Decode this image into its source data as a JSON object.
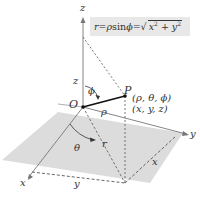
{
  "diagram": {
    "formula": {
      "lhs": "r",
      "eq1": " = ",
      "rho": "ρ",
      "sin": " sin ",
      "phi": "ϕ",
      "eq2": " = ",
      "radical_sign": "√",
      "radicand_x": "x",
      "exp1": "2",
      "plus": " + ",
      "radicand_y": "y",
      "exp2": "2"
    },
    "labels": {
      "z_axis_top": "z",
      "z_height": "z",
      "phi_angle": "ϕ",
      "origin": "O",
      "point": "P",
      "spherical_coords": "(ρ, θ, ϕ)",
      "rect_coords": "(x, y, z)",
      "rho_length": "ρ",
      "theta_angle": "θ",
      "r_length": "r",
      "y_axis": "y",
      "x_axis": "x",
      "y_length": "y",
      "x_length": "x"
    },
    "colors": {
      "plane_fill": "#dcdcdc",
      "axis": "#777777",
      "dashed": "#555555",
      "rho_segment": "#111111",
      "formula_bg": "#e8e8e8"
    }
  }
}
